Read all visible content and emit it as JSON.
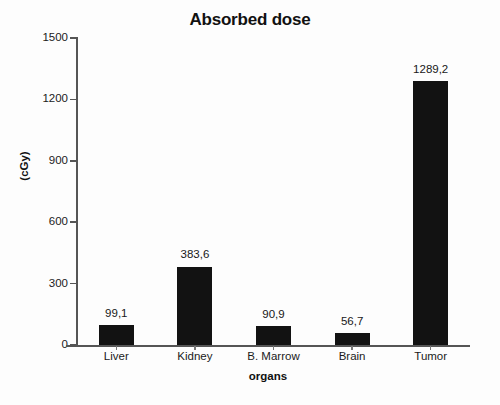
{
  "chart_data": {
    "type": "bar",
    "title": "Absorbed dose",
    "xlabel": "organs",
    "ylabel": "(cGy)",
    "categories": [
      "Liver",
      "Kidney",
      "B. Marrow",
      "Brain",
      "Tumor"
    ],
    "values": [
      99.1,
      383.6,
      90.9,
      56.7,
      1289.2
    ],
    "value_labels": [
      "99,1",
      "383,6",
      "90,9",
      "56,7",
      "1289,2"
    ],
    "ylim": [
      0,
      1500
    ],
    "yticks": [
      0,
      300,
      600,
      900,
      1200,
      1500
    ],
    "ytick_labels": [
      "0",
      "300",
      "600",
      "900",
      "1200",
      "1500"
    ],
    "grid": false,
    "legend": false,
    "bar_color": "#121212",
    "background_color": "#fdfdfd",
    "axis_color": "#555555",
    "decimal_separator": ","
  }
}
